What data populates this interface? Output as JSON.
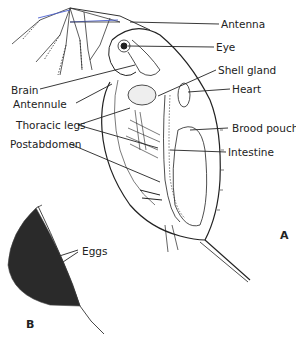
{
  "figure": {
    "panel_a_label": "A",
    "panel_b_label": "B"
  },
  "labels": {
    "antenna": "Antenna",
    "eye": "Eye",
    "shell_gland": "Shell gland",
    "heart": "Heart",
    "brain": "Brain",
    "antennule": "Antennule",
    "thoracic_legs": "Thoracic legs",
    "brood_pouch": "Brood pouch",
    "intestine": "Intestine",
    "postabdomen": "Postabdomen",
    "eggs": "Eggs"
  },
  "colors": {
    "ink": "#222222",
    "accent_antenna": "#4a5fd0",
    "eggs_fill": "#2a2a2a"
  }
}
